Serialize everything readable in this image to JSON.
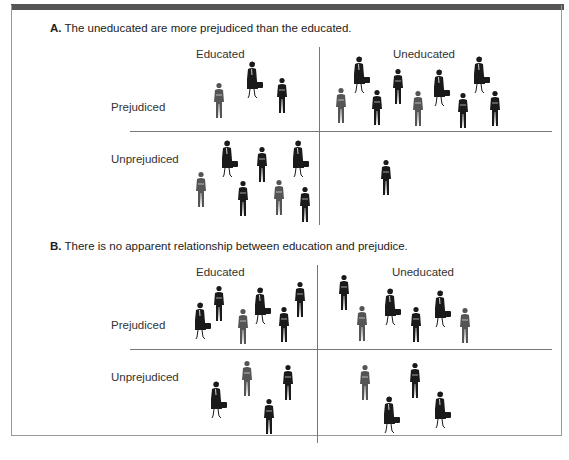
{
  "panels": [
    {
      "letter": "A.",
      "caption": "The uneducated are more prejudiced than the educated.",
      "columns": [
        "Educated",
        "Uneducated"
      ],
      "rows": [
        "Prejudiced",
        "Unprejudiced"
      ],
      "counts": {
        "educated_prejudiced": 3,
        "uneducated_prejudiced": 9,
        "educated_unprejudiced": 8,
        "uneducated_unprejudiced": 1
      }
    },
    {
      "letter": "B.",
      "caption": "There is no apparent relationship between education and prejudice.",
      "columns": [
        "Educated",
        "Uneducated"
      ],
      "rows": [
        "Prejudiced",
        "Unprejudiced"
      ],
      "counts": {
        "educated_prejudiced": 6,
        "uneducated_prejudiced": 6,
        "educated_unprejudiced": 4,
        "uneducated_unprejudiced": 4
      }
    }
  ],
  "icons": {
    "man": "man-figure-icon",
    "woman": "woman-with-briefcase-icon"
  },
  "colors": {
    "frame_bar": "#555555",
    "dark_figure": "#1a1a1a",
    "gray_figure": "#555555"
  }
}
